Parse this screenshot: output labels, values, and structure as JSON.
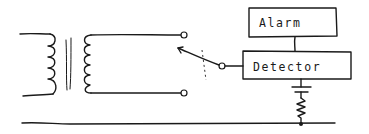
{
  "diagram": {
    "style": "hand-drawn schematic",
    "ink_color": "#1a1a1a",
    "background": "#ffffff",
    "components": [
      {
        "id": "transformer",
        "type": "transformer",
        "primary_windings": 5,
        "secondary_windings": 6
      },
      {
        "id": "switch",
        "type": "two-way switch",
        "terminals": 3
      },
      {
        "id": "detector",
        "type": "box",
        "label": "Detector"
      },
      {
        "id": "alarm",
        "type": "box",
        "label": "Alarm"
      },
      {
        "id": "battery",
        "type": "capacitor-or-battery"
      },
      {
        "id": "resistor",
        "type": "resistor"
      },
      {
        "id": "ground-rail",
        "type": "wire"
      }
    ],
    "connections": [
      [
        "transformer.secondary.top",
        "switch.terminal-upper"
      ],
      [
        "transformer.secondary.bottom",
        "switch.terminal-lower"
      ],
      [
        "switch.common",
        "detector.left"
      ],
      [
        "detector.top",
        "alarm.bottom"
      ],
      [
        "detector.bottom",
        "battery"
      ],
      [
        "battery",
        "resistor"
      ],
      [
        "resistor",
        "ground-rail"
      ]
    ],
    "labels": {
      "alarm": "Alarm",
      "detector": "Detector"
    }
  }
}
